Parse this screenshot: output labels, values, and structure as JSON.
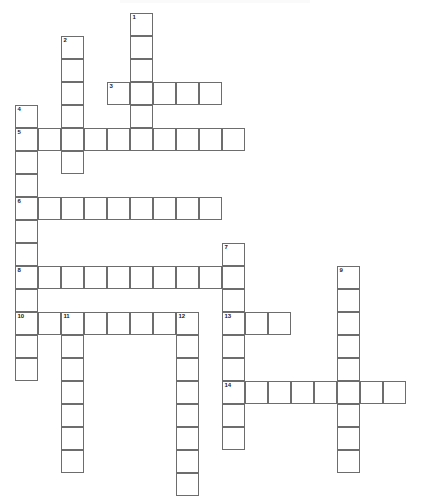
{
  "puzzle": {
    "title": "Crossword Puzzle Grid",
    "kind": "blank-crossword-grid",
    "cell_size_px": 23,
    "origin_x_px": 15,
    "origin_y_px": 13,
    "line_color": "#6d6d6d",
    "cell_fill": "#ffffff",
    "background": "#ffffff",
    "number_color": "#1a1a1a",
    "total_entries": 14,
    "across_count": 6,
    "down_count": 8,
    "entries": [
      {
        "number": "1",
        "direction": "down",
        "col": 5,
        "row": 0,
        "length": 5,
        "letters": [
          "",
          "",
          "",
          "",
          ""
        ]
      },
      {
        "number": "2",
        "direction": "down",
        "col": 2,
        "row": 1,
        "length": 6,
        "letters": [
          "",
          "",
          "",
          "",
          "",
          ""
        ]
      },
      {
        "number": "3",
        "direction": "across",
        "col": 4,
        "row": 3,
        "length": 5,
        "letters": [
          "",
          "",
          "",
          "",
          ""
        ]
      },
      {
        "number": "4",
        "direction": "down",
        "col": 0,
        "row": 4,
        "length": 9,
        "letters": [
          "",
          "",
          "",
          "",
          "",
          "",
          "",
          "",
          ""
        ]
      },
      {
        "number": "5",
        "direction": "across",
        "col": 0,
        "row": 5,
        "length": 10,
        "letters": [
          "",
          "",
          "",
          "",
          "",
          "",
          "",
          "",
          "",
          ""
        ]
      },
      {
        "number": "6",
        "direction": "across",
        "col": 0,
        "row": 8,
        "length": 9,
        "letters": [
          "",
          "",
          "",
          "",
          "",
          "",
          "",
          "",
          ""
        ]
      },
      {
        "number": "7",
        "direction": "down",
        "col": 9,
        "row": 10,
        "length": 9,
        "letters": [
          "",
          "",
          "",
          "",
          "",
          "",
          "",
          "",
          ""
        ]
      },
      {
        "number": "8",
        "direction": "across",
        "col": 0,
        "row": 11,
        "length": 10,
        "letters": [
          "",
          "",
          "",
          "",
          "",
          "",
          "",
          "",
          "",
          ""
        ]
      },
      {
        "number": "9",
        "direction": "down",
        "col": 14,
        "row": 11,
        "length": 9,
        "letters": [
          "",
          "",
          "",
          "",
          "",
          "",
          "",
          "",
          ""
        ]
      },
      {
        "number": "10",
        "direction": "down",
        "col": 0,
        "row": 13,
        "length": 3,
        "letters": [
          "",
          "",
          ""
        ]
      },
      {
        "number": "11",
        "direction": "down",
        "col": 2,
        "row": 13,
        "length": 7,
        "letters": [
          "",
          "",
          "",
          "",
          "",
          "",
          ""
        ]
      },
      {
        "number": "12",
        "direction": "down",
        "col": 7,
        "row": 13,
        "length": 8,
        "letters": [
          "",
          "",
          "",
          "",
          "",
          "",
          "",
          ""
        ]
      },
      {
        "number": "13",
        "direction": "across",
        "col": 9,
        "row": 13,
        "length": 3,
        "letters": [
          "",
          "",
          ""
        ]
      },
      {
        "number": "14",
        "direction": "across",
        "col": 9,
        "row": 16,
        "length": 8,
        "letters": [
          "",
          "",
          "",
          "",
          "",
          "",
          "",
          ""
        ]
      }
    ],
    "row10_across": {
      "number": "10",
      "direction": "across",
      "col": 0,
      "row": 13,
      "length": 8
    }
  }
}
